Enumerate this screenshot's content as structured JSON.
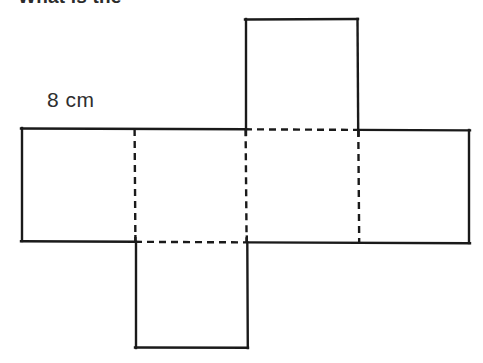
{
  "page": {
    "background_color": "#ffffff",
    "width": 483,
    "height": 363
  },
  "question": {
    "text": "What is the",
    "note": "partially cropped at top edge of image"
  },
  "labels": {
    "edge_length": "8 cm"
  },
  "figure": {
    "name": "cube-net",
    "stroke_color": "#1a1a1a",
    "solid_stroke_width": 2.4,
    "dashed_stroke_width": 2.4,
    "dash_pattern": "7 5",
    "square_count": 6,
    "geometry": {
      "band": {
        "left": 21,
        "right": 470,
        "top": 128,
        "bottom": 241
      },
      "band_right_top": 130,
      "band_right_bottom": 243,
      "band_dividers_x": [
        134,
        245,
        359
      ],
      "top_square": {
        "left": 245,
        "right": 358,
        "top": 18,
        "bottom": 128
      },
      "bottom_square": {
        "left": 135,
        "right": 248,
        "top": 241,
        "bottom": 348
      }
    }
  }
}
